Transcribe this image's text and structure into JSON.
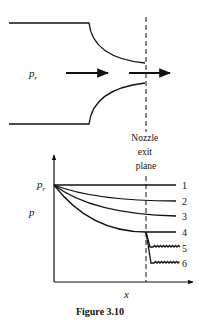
{
  "nozzle": {
    "inlet_pressure_label": "p",
    "inlet_pressure_subscript": "r"
  },
  "exit_plane_label": [
    "Nozzle",
    "exit",
    "plane"
  ],
  "plot": {
    "y_axis_label": "p",
    "x_axis_label": "x",
    "start_label": "p",
    "start_subscript": "r",
    "curve_labels": [
      "1",
      "2",
      "3",
      "4",
      "5",
      "6"
    ]
  },
  "caption": "Figure 3.10"
}
